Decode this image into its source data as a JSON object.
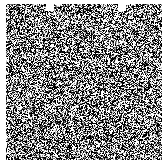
{
  "image": {
    "description": "Square field of random black and white pixel noise on a white background",
    "width": 168,
    "height": 167,
    "noise_area": {
      "x": 6,
      "y": 4,
      "width": 156,
      "height": 156
    },
    "notches": [
      {
        "x": 46,
        "y": 4,
        "width": 8,
        "height": 7
      },
      {
        "x": 118,
        "y": 4,
        "width": 8,
        "height": 7
      }
    ],
    "colors": {
      "background": "#ffffff",
      "dark": "#000000",
      "light": "#ffffff"
    },
    "density": 0.5,
    "seed": 1337
  }
}
